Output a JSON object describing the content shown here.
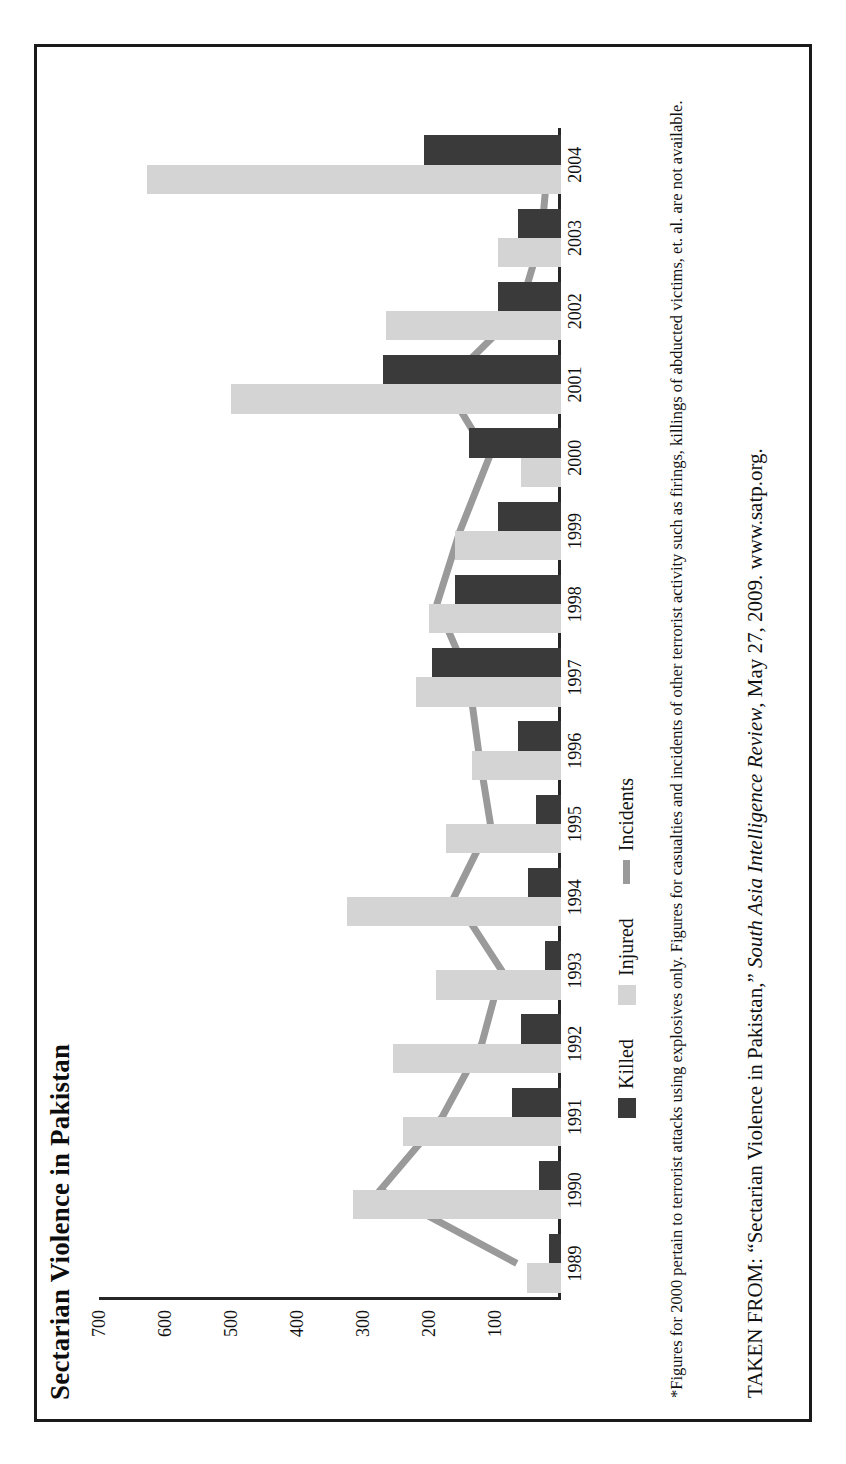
{
  "figure": {
    "title": "Sectarian Violence in Pakistan",
    "footnote": "*Figures for 2000 pertain to terrorist attacks using explosives only. Figures for casualties and incidents of other terrorist activity such as firings, killings of abducted victims, et. al. are not available.",
    "source_prefix": "TAKEN FROM: “Sectarian Violence in Pakistan,” ",
    "source_italic": "South Asia Intelligence Review",
    "source_suffix": ", May 27, 2009. www.satp.org."
  },
  "legend": {
    "position": "below-plot",
    "items": [
      {
        "label": "Killed",
        "color": "#3a3a3a",
        "marker": "square"
      },
      {
        "label": "Injured",
        "color": "#d4d4d4",
        "marker": "square"
      },
      {
        "label": "Incidents",
        "color": "#9a9a9a",
        "marker": "line"
      }
    ]
  },
  "axis": {
    "value_ticks": [
      "700",
      "600",
      "500",
      "400",
      "300",
      "200",
      "100"
    ],
    "value_tick_numbers": [
      700,
      600,
      500,
      400,
      300,
      200,
      100
    ],
    "max": 700,
    "min": 0,
    "grid": false
  },
  "chart_data": {
    "type": "bar",
    "title": "Sectarian Violence in Pakistan",
    "xlabel": "",
    "ylabel": "",
    "ylim": [
      0,
      700
    ],
    "orientation": "rotated-90",
    "categories": [
      "1989",
      "1990",
      "1991",
      "1992",
      "1993",
      "1994",
      "1995",
      "1996",
      "1997",
      "1998",
      "1999",
      "2000",
      "2001",
      "2002",
      "2003",
      "2004"
    ],
    "series": [
      {
        "name": "Killed",
        "type": "bar",
        "color": "#3a3a3a",
        "values": [
          18,
          33,
          75,
          60,
          24,
          50,
          38,
          65,
          195,
          160,
          95,
          140,
          270,
          95,
          65,
          207
        ]
      },
      {
        "name": "Injured",
        "type": "bar",
        "color": "#d4d4d4",
        "values": [
          52,
          315,
          240,
          255,
          190,
          325,
          175,
          135,
          220,
          200,
          160,
          60,
          500,
          265,
          95,
          627
        ]
      },
      {
        "name": "Incidents",
        "type": "line",
        "color": "#9a9a9a",
        "values": [
          67,
          274,
          180,
          120,
          90,
          162,
          107,
          125,
          140,
          188,
          153,
          109,
          176,
          63,
          30,
          20
        ]
      }
    ]
  }
}
